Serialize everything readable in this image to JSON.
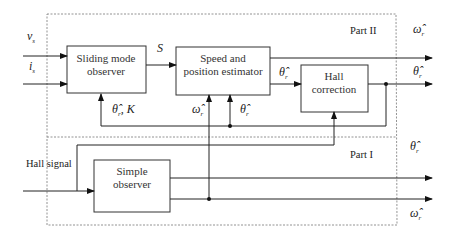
{
  "diagram": {
    "regions": {
      "part2_label": "Part II",
      "part1_label": "Part I"
    },
    "blocks": {
      "sliding_mode_observer": [
        "Sliding mode",
        "observer"
      ],
      "speed_position_estimator": [
        "Speed and",
        "position estimator"
      ],
      "hall_correction": [
        "Hall",
        "correction"
      ],
      "simple_observer": [
        "Simple",
        "observer"
      ]
    },
    "inputs": {
      "vs": {
        "base": "v",
        "sub": "s"
      },
      "is": {
        "base": "i",
        "sub": "s"
      },
      "hall_signal": "Hall signal"
    },
    "signals": {
      "S": "S",
      "theta_hat": {
        "base": "θ̂",
        "sub": "r"
      },
      "omega_hat": {
        "base": "ω̂",
        "sub": "r"
      },
      "feedback_theta_K": {
        "base": "θ̂",
        "sub": "r",
        "tail": ", K"
      }
    },
    "outputs": {
      "part2_omega": {
        "base": "ω̂",
        "sub": "r"
      },
      "part2_theta": {
        "base": "θ̂",
        "sub": "r"
      },
      "part1_theta": {
        "base": "θ̂",
        "sub": "r"
      },
      "part1_omega": {
        "base": "ω̂",
        "sub": "r"
      }
    }
  }
}
